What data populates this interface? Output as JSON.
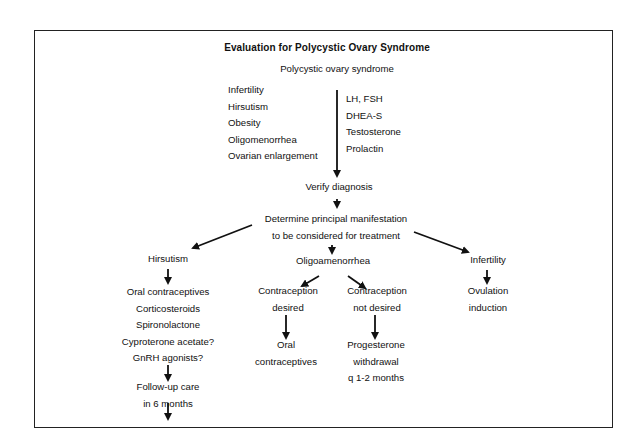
{
  "title": "Evaluation for Polycystic Ovary Syndrome",
  "root": "Polycystic ovary syndrome",
  "symptoms": [
    "Infertility",
    "Hirsutism",
    "Obesity",
    "Oligomenorrhea",
    "Ovarian enlargement"
  ],
  "labs": [
    "LH, FSH",
    "DHEA-S",
    "Testosterone",
    "Prolactin"
  ],
  "verify": "Verify diagnosis",
  "determine": [
    "Determine principal manifestation",
    "to be considered for treatment"
  ],
  "branches": {
    "hirsutism": {
      "label": "Hirsutism",
      "treatments": [
        "Oral contraceptives",
        "Corticosteroids",
        "Spironolactone",
        "Cyproterone acetate?",
        "GnRH agonists?"
      ],
      "followup": [
        "Follow-up care",
        "in 6 months"
      ],
      "repeat": [
        "Repeat androgens,",
        "depilation"
      ]
    },
    "oligo": {
      "label": "Oligoamenorrhea",
      "desired": {
        "label": [
          "Contraception",
          "desired"
        ],
        "result": [
          "Oral",
          "contraceptives"
        ]
      },
      "not_desired": {
        "label": [
          "Contraception",
          "not desired"
        ],
        "result": [
          "Progesterone",
          "withdrawal",
          "q 1-2 months"
        ]
      }
    },
    "infertility": {
      "label": "Infertility",
      "result": [
        "Ovulation",
        "induction"
      ]
    }
  }
}
